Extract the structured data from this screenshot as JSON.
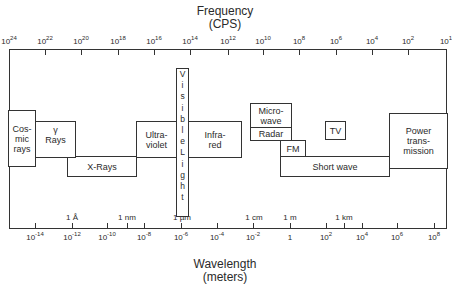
{
  "titles": {
    "frequency": "Frequency",
    "frequency_unit": "(CPS)",
    "wavelength": "Wavelength",
    "wavelength_unit": "(meters)"
  },
  "frequency_ticks": [
    {
      "base": "10",
      "exp": "24"
    },
    {
      "base": "10",
      "exp": "22"
    },
    {
      "base": "10",
      "exp": "20"
    },
    {
      "base": "10",
      "exp": "18"
    },
    {
      "base": "10",
      "exp": "16"
    },
    {
      "base": "10",
      "exp": "14"
    },
    {
      "base": "10",
      "exp": "12"
    },
    {
      "base": "10",
      "exp": "10"
    },
    {
      "base": "10",
      "exp": "8"
    },
    {
      "base": "10",
      "exp": "6"
    },
    {
      "base": "10",
      "exp": "4"
    },
    {
      "base": "10",
      "exp": "2"
    },
    {
      "base": "10",
      "exp": "1"
    }
  ],
  "wavelength_ticks": [
    {
      "base": "10",
      "exp": "-14"
    },
    {
      "base": "10",
      "exp": "-12"
    },
    {
      "base": "10",
      "exp": "-10"
    },
    {
      "base": "10",
      "exp": "-8"
    },
    {
      "base": "10",
      "exp": "-6"
    },
    {
      "base": "10",
      "exp": "-4"
    },
    {
      "base": "10",
      "exp": "-2"
    },
    {
      "base": "1",
      "exp": ""
    },
    {
      "base": "10",
      "exp": "2"
    },
    {
      "base": "10",
      "exp": "4"
    },
    {
      "base": "10",
      "exp": "6"
    },
    {
      "base": "10",
      "exp": "8"
    }
  ],
  "unit_marks": [
    "1 Å",
    "1 nm",
    "1 µm",
    "1 cm",
    "1 m",
    "1 km"
  ],
  "bands": {
    "cosmic": [
      "Cos-",
      "mic",
      "rays"
    ],
    "gamma": [
      "γ",
      "Rays"
    ],
    "xrays": "X-Rays",
    "uv": [
      "Ultra-",
      "violet"
    ],
    "visible": [
      "V",
      "i",
      "s",
      "i",
      "b",
      "l",
      "e",
      "L",
      "i",
      "g",
      "h",
      "t"
    ],
    "infrared": [
      "Infra-",
      "red"
    ],
    "microwave": [
      "Micro-",
      "wave"
    ],
    "radar": "Radar",
    "fm": "FM",
    "tv": "TV",
    "shortwave": "Short wave",
    "power": [
      "Power",
      "trans-",
      "mission"
    ]
  }
}
